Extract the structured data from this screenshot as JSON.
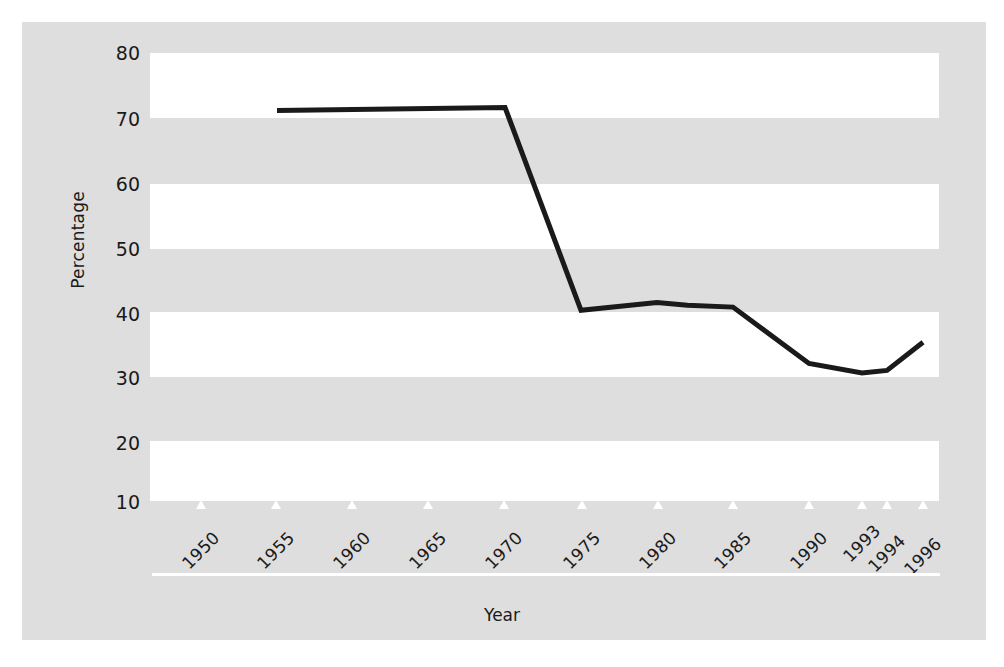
{
  "chart_data": {
    "type": "line",
    "title": "",
    "xlabel": "Year",
    "ylabel": "Percentage",
    "xlim": [
      1948,
      1997
    ],
    "ylim": [
      10,
      80
    ],
    "ytick_labels": [
      "80",
      "70",
      "60",
      "50",
      "40",
      "30",
      "20",
      "10"
    ],
    "ytick_values": [
      80,
      70,
      60,
      50,
      40,
      30,
      20,
      10
    ],
    "xtick_labels": [
      "1950",
      "1955",
      "1960",
      "1965",
      "1970",
      "1975",
      "1980",
      "1985",
      "1990",
      "1993",
      "1994",
      "1996"
    ],
    "xtick_values": [
      1950,
      1955,
      1960,
      1965,
      1970,
      1975,
      1980,
      1985,
      1990,
      1993,
      1994,
      1996
    ],
    "grid": "alternating-white-bands",
    "legend": null,
    "series": [
      {
        "name": "Percentage",
        "color": "#1a1a1a",
        "x": [
          1955,
          1970,
          1975,
          1980,
          1982,
          1985,
          1990,
          1993,
          1994,
          1996
        ],
        "values": [
          71.0,
          71.5,
          39.8,
          41.0,
          40.6,
          40.3,
          31.5,
          30.0,
          30.4,
          34.8
        ]
      }
    ]
  },
  "axes": {
    "y_title": "Percentage",
    "x_title": "Year"
  }
}
